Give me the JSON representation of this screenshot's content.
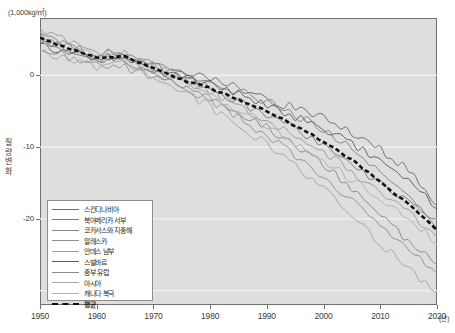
{
  "axes": {
    "unit_top": "(1,000kg/㎡)",
    "ylabel": "질량변화",
    "yticks": [
      "0",
      "-10",
      "-20"
    ],
    "xticks": [
      "1950",
      "1960",
      "1970",
      "1980",
      "1990",
      "2000",
      "2010",
      "2020"
    ],
    "xunit": "(년)"
  },
  "legend": {
    "items": [
      {
        "label": "스칸디나비아",
        "color": "#6e6e6e"
      },
      {
        "label": "북아메리카 서부",
        "color": "#7a7a7a"
      },
      {
        "label": "코카서스와 지중해",
        "color": "#868686"
      },
      {
        "label": "알래스카",
        "color": "#929292"
      },
      {
        "label": "안데스 남부",
        "color": "#9d9d9d"
      },
      {
        "label": "스발바르",
        "color": "#5f5f5f"
      },
      {
        "label": "중부 유럽",
        "color": "#8a8a8a"
      },
      {
        "label": "아시아",
        "color": "#a8a8a8"
      },
      {
        "label": "캐나다 북극",
        "color": "#b2b2b2"
      },
      {
        "label": "평균",
        "color": "#111111"
      }
    ]
  },
  "chart_data": {
    "type": "line",
    "title": "",
    "xlabel": "(년)",
    "ylabel": "질량변화",
    "unit": "(1,000kg/㎡)",
    "xlim": [
      1950,
      2020
    ],
    "ylim": [
      -32,
      8
    ],
    "grid": true,
    "grid_values": [
      0,
      -10,
      -20,
      -30
    ],
    "legend_position": "inside-lower-left",
    "x": [
      1950,
      1955,
      1960,
      1965,
      1970,
      1975,
      1980,
      1985,
      1990,
      1995,
      2000,
      2005,
      2010,
      2015,
      2020
    ],
    "series": [
      {
        "name": "스칸디나비아",
        "color": "#6e6e6e",
        "style": "solid",
        "values": [
          5.0,
          3.6,
          2.2,
          2.8,
          1.2,
          0.2,
          -0.4,
          -1.8,
          -3.2,
          -4.6,
          -6.0,
          -8.0,
          -10.4,
          -13.0,
          -18.2
        ]
      },
      {
        "name": "북아메리카 서부",
        "color": "#7a7a7a",
        "style": "solid",
        "values": [
          4.6,
          3.4,
          2.0,
          2.0,
          0.6,
          -0.2,
          -1.8,
          -3.6,
          -5.6,
          -7.4,
          -9.6,
          -12.4,
          -15.2,
          -17.6,
          "-20.0"
        ]
      },
      {
        "name": "코카서스와 지중해",
        "color": "#868686",
        "style": "solid",
        "values": [
          5.4,
          4.2,
          3.0,
          3.4,
          1.6,
          0.4,
          -1.0,
          -2.2,
          -3.6,
          -5.4,
          -7.6,
          -10.2,
          -13.4,
          -17.0,
          -21.4
        ]
      },
      {
        "name": "알래스카",
        "color": "#929292",
        "style": "solid",
        "values": [
          3.8,
          2.6,
          1.4,
          1.0,
          0.0,
          -1.4,
          -3.4,
          -5.8,
          -8.4,
          -11.2,
          -14.0,
          -17.4,
          -21.0,
          -24.4,
          -27.6
        ]
      },
      {
        "name": "안데스 남부",
        "color": "#9d9d9d",
        "style": "solid",
        "values": [
          6.2,
          4.8,
          3.2,
          3.0,
          1.4,
          -0.6,
          -2.2,
          -4.2,
          -6.2,
          -8.2,
          -10.6,
          -13.4,
          -16.4,
          -19.2,
          -22.6
        ]
      },
      {
        "name": "스발바르",
        "color": "#5f5f5f",
        "style": "solid",
        "values": [
          4.2,
          3.2,
          2.4,
          2.6,
          0.8,
          -0.4,
          -1.2,
          -2.6,
          -4.2,
          -5.8,
          -7.4,
          -9.6,
          -12.0,
          -14.6,
          -18.6
        ]
      },
      {
        "name": "중부 유럽",
        "color": "#8a8a8a",
        "style": "solid",
        "values": [
          5.8,
          4.0,
          2.6,
          2.2,
          0.4,
          -1.2,
          -3.0,
          -5.0,
          -7.2,
          -9.6,
          -12.4,
          -15.8,
          -19.4,
          -23.0,
          -26.4
        ]
      },
      {
        "name": "아시아",
        "color": "#a8a8a8",
        "style": "solid",
        "values": [
          3.4,
          2.2,
          1.0,
          1.6,
          -0.4,
          -2.0,
          -4.4,
          -7.0,
          -9.6,
          -12.6,
          -15.8,
          -19.4,
          -23.4,
          -27.0,
          -30.2
        ]
      },
      {
        "name": "캐나다 북극",
        "color": "#b2b2b2",
        "style": "solid",
        "values": [
          4.8,
          3.8,
          2.8,
          2.4,
          1.0,
          -0.8,
          -2.6,
          -4.8,
          -7.0,
          -9.4,
          -11.8,
          -14.6,
          -17.4,
          -20.2,
          -23.4
        ]
      },
      {
        "name": "평균",
        "color": "#111111",
        "style": "dashed",
        "values": [
          5.2,
          3.8,
          2.4,
          2.6,
          1.0,
          -0.6,
          -1.8,
          -3.4,
          -5.0,
          -7.0,
          -9.2,
          -11.8,
          -14.8,
          -18.0,
          -21.6
        ]
      }
    ]
  }
}
